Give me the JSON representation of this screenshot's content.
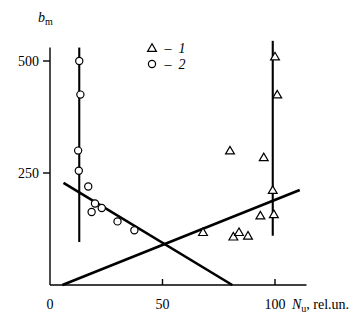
{
  "chart_data": {
    "type": "scatter",
    "title": "",
    "subtitle": "",
    "xlabel": "N_u, rel.un.",
    "xlabel_parts": {
      "symbol": "N",
      "sub": "u",
      "rest": ", rel.un."
    },
    "ylabel": "b_m",
    "ylabel_parts": {
      "symbol": "b",
      "sub": "m"
    },
    "xlim": [
      0,
      110
    ],
    "ylim": [
      0,
      530
    ],
    "xticks": [
      0,
      50,
      100
    ],
    "xticklabels": [
      "0",
      "50",
      "100"
    ],
    "yticks": [
      250,
      500
    ],
    "yticklabels": [
      "250",
      "500"
    ],
    "grid": false,
    "legend_position": "upper-center",
    "legend": [
      {
        "marker": "triangle",
        "dash": "–",
        "label": "1"
      },
      {
        "marker": "circle",
        "dash": "–",
        "label": "2"
      }
    ],
    "series": [
      {
        "name": "1",
        "marker": "triangle",
        "points": [
          {
            "x": 68.0,
            "y": 118.0
          },
          {
            "x": 81.5,
            "y": 108.0
          },
          {
            "x": 84.0,
            "y": 118.0
          },
          {
            "x": 88.0,
            "y": 110.0
          },
          {
            "x": 93.5,
            "y": 155.0
          },
          {
            "x": 99.5,
            "y": 158.0
          },
          {
            "x": 99.0,
            "y": 212.0
          },
          {
            "x": 95.0,
            "y": 285.0
          },
          {
            "x": 80.0,
            "y": 300.0
          },
          {
            "x": 101.0,
            "y": 425.0
          },
          {
            "x": 100.0,
            "y": 510.0
          }
        ]
      },
      {
        "name": "2",
        "marker": "circle",
        "points": [
          {
            "x": 13.0,
            "y": 500.0
          },
          {
            "x": 13.5,
            "y": 425.0
          },
          {
            "x": 12.5,
            "y": 300.0
          },
          {
            "x": 12.8,
            "y": 255.0
          },
          {
            "x": 17.0,
            "y": 220.0
          },
          {
            "x": 20.0,
            "y": 182.0
          },
          {
            "x": 18.5,
            "y": 163.0
          },
          {
            "x": 23.0,
            "y": 172.0
          },
          {
            "x": 30.0,
            "y": 142.0
          },
          {
            "x": 37.5,
            "y": 122.0
          }
        ]
      }
    ],
    "fit_lines": [
      {
        "name": "descending-trend",
        "x1": 6.0,
        "y1": 228.0,
        "x2": 81.0,
        "y2": 0.0
      },
      {
        "name": "ascending-trend",
        "x1": 5.5,
        "y1": 0.0,
        "x2": 111.0,
        "y2": 212.0
      }
    ],
    "vertical_lines": [
      {
        "name": "left-cluster-line",
        "x": 13.0,
        "y1": 96.0,
        "y2": 530.0
      },
      {
        "name": "right-cluster-line",
        "x": 99.0,
        "y1": 110.0,
        "y2": 545.0
      }
    ]
  }
}
